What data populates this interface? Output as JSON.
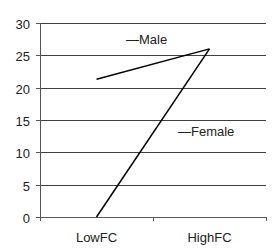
{
  "chart_data": {
    "type": "line",
    "title": "",
    "xlabel": "",
    "ylabel": "",
    "categories": [
      "LowFC",
      "HighFC"
    ],
    "series": [
      {
        "name": "Male",
        "values": [
          21.3,
          26.0
        ],
        "color": "#000000"
      },
      {
        "name": "Female",
        "values": [
          0,
          26.0
        ],
        "color": "#000000"
      }
    ],
    "ylim": [
      0,
      30
    ],
    "yticks": [
      0,
      5,
      10,
      15,
      20,
      25,
      30
    ],
    "grid": {
      "horizontal": true,
      "vertical": false,
      "color": "#404040"
    },
    "legend": {
      "style": "inline-labels",
      "entries": [
        {
          "label": "Male",
          "x_px": 126,
          "y_px": 44
        },
        {
          "label": "Female",
          "x_px": 178,
          "y_px": 136
        }
      ]
    }
  }
}
